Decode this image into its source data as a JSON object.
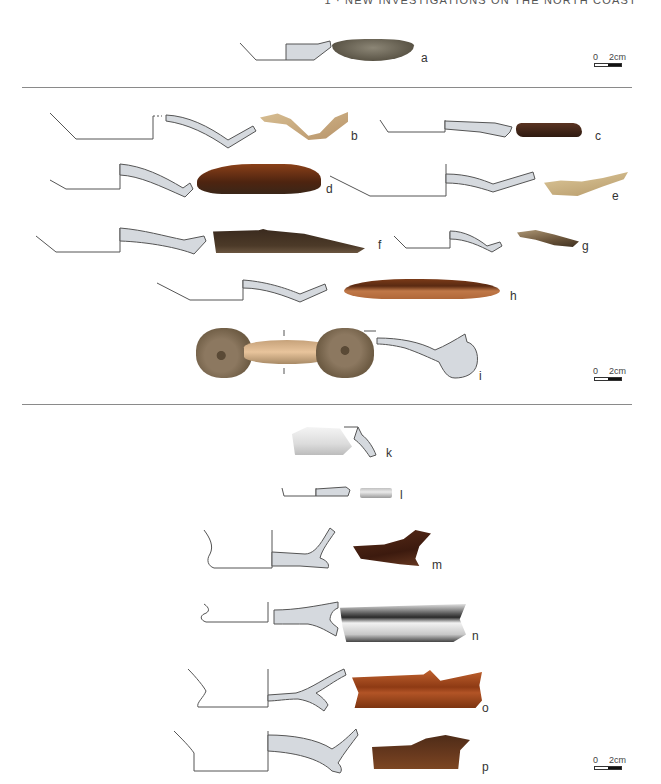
{
  "page": {
    "running_head": "1 · NEW INVESTIGATIONS ON THE NORTH COAST"
  },
  "sections": [
    {
      "id": "top",
      "scale_bar": {
        "start": "0",
        "end": "2cm"
      },
      "items": [
        {
          "label": "a",
          "type": "profile+photo",
          "photo_color": "#6b6455"
        }
      ]
    },
    {
      "id": "middle",
      "scale_bar": {
        "start": "0",
        "end": "2cm"
      },
      "items": [
        {
          "label": "b",
          "type": "profile+photo",
          "photo_color": "#c9a97a"
        },
        {
          "label": "c",
          "type": "profile+photo",
          "photo_color": "#4a2a1c"
        },
        {
          "label": "d",
          "type": "profile+photo",
          "photo_color": "#6a3218"
        },
        {
          "label": "e",
          "type": "profile+photo",
          "photo_color": "#c8b284"
        },
        {
          "label": "f",
          "type": "profile+photo",
          "photo_color": "#3d2c20"
        },
        {
          "label": "g",
          "type": "profile+photo",
          "photo_color": "#6e5a40"
        },
        {
          "label": "h",
          "type": "profile+photo",
          "photo_color": "#8a4a26"
        },
        {
          "label": "i",
          "type": "photo+profile",
          "photo_color": "#8a7458"
        }
      ]
    },
    {
      "id": "bottom",
      "scale_bar": {
        "start": "0",
        "end": "2cm"
      },
      "items": [
        {
          "label": "k",
          "type": "photo+profile",
          "photo_color": "#e6e6e6"
        },
        {
          "label": "l",
          "type": "profile+photo",
          "photo_color": "#d0d0d0"
        },
        {
          "label": "m",
          "type": "profile+photo",
          "photo_color": "#4a2416"
        },
        {
          "label": "n",
          "type": "profile+photo",
          "photo_color": "#d8d8d8"
        },
        {
          "label": "o",
          "type": "profile+photo",
          "photo_color": "#a84e22"
        },
        {
          "label": "p",
          "type": "profile+photo",
          "photo_color": "#5e3218"
        }
      ]
    }
  ]
}
